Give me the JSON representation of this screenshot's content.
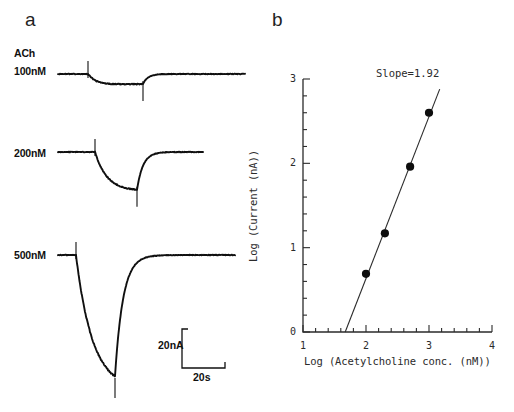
{
  "figure": {
    "panels": [
      {
        "letter": "a"
      },
      {
        "letter": "b"
      }
    ],
    "background_color": "#ffffff",
    "ink_color": "#101010"
  },
  "panel_a": {
    "letter": "a",
    "agonist_label": "ACh",
    "traces": [
      {
        "concentration_label": "100nM",
        "concentration_nM": 100,
        "peak_current_nA": 4.9,
        "baseline_y": 74
      },
      {
        "concentration_label": "200nM",
        "concentration_nM": 200,
        "peak_current_nA": 14.8,
        "baseline_y": 152
      },
      {
        "concentration_label": "500nM",
        "concentration_nM": 500,
        "peak_current_nA": 92.0,
        "baseline_y": 255
      }
    ],
    "scale_bar": {
      "current_label": "20nA",
      "time_label": "20s",
      "current_value_nA": 20,
      "time_value_s": 20
    }
  },
  "panel_b": {
    "letter": "b",
    "annotation": "Slope=1.92"
  },
  "chart_data": {
    "type": "scatter",
    "title": "",
    "annotation": "Slope=1.92",
    "slope": 1.92,
    "xlabel": "Log (Acetylcholine conc. (nM))",
    "ylabel": "Log (Current (nA))",
    "xlim": [
      1,
      4
    ],
    "ylim": [
      0,
      3
    ],
    "x_major_ticks": [
      1,
      2,
      3,
      4
    ],
    "y_major_ticks": [
      0,
      1,
      2,
      3
    ],
    "x_tick_labels": [
      "1",
      "2",
      "3",
      "4"
    ],
    "y_tick_labels": [
      "0",
      "1",
      "2",
      "3"
    ],
    "x_minor_step": 0.2,
    "y_minor_step": 0.2,
    "grid": false,
    "legend": false,
    "series": [
      {
        "name": "ACh dose-response",
        "marker": "filled-circle",
        "x": [
          2.0,
          2.3,
          2.7,
          3.0
        ],
        "y": [
          0.69,
          1.17,
          1.96,
          2.6
        ]
      }
    ],
    "fit_line": {
      "slope": 1.92,
      "x_start": 1.67,
      "y_start": 0.0,
      "x_end": 3.17,
      "y_end": 2.88
    }
  }
}
